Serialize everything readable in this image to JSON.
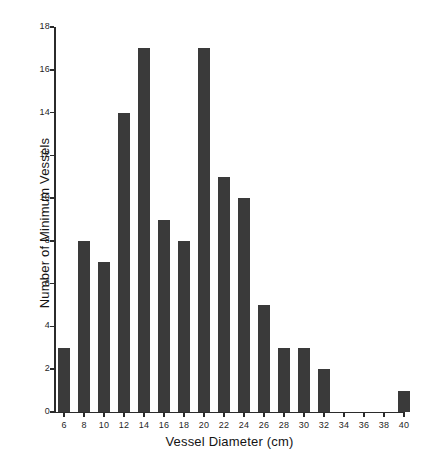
{
  "chart_data": {
    "type": "bar",
    "title": "",
    "subtitle": "",
    "xlabel": "Vessel Diameter (cm)",
    "ylabel": "Number of Minimum Vessels",
    "categories": [
      6,
      8,
      10,
      12,
      14,
      16,
      18,
      20,
      22,
      24,
      26,
      28,
      30,
      32,
      34,
      36,
      38,
      40
    ],
    "values": [
      3,
      8,
      7,
      14,
      17,
      9,
      8,
      17,
      11,
      10,
      5,
      3,
      3,
      2,
      0,
      0,
      0,
      1
    ],
    "x_tick_labels": [
      "6",
      "8",
      "10",
      "12",
      "14",
      "16",
      "18",
      "20",
      "22",
      "24",
      "26",
      "28",
      "30",
      "32",
      "34",
      "36",
      "38",
      "40"
    ],
    "y_tick_labels": [
      "0",
      "2",
      "4",
      "6",
      "8",
      "10",
      "12",
      "14",
      "16",
      "18"
    ],
    "y_ticks": [
      0,
      2,
      4,
      6,
      8,
      10,
      12,
      14,
      16,
      18
    ],
    "ylim": [
      0,
      18
    ],
    "xlim": [
      5,
      41
    ],
    "grid": false,
    "legend": null,
    "bar_color": "#3a3a3a",
    "axis_color": "#2b2b2b",
    "background_color": "#ffffff"
  }
}
